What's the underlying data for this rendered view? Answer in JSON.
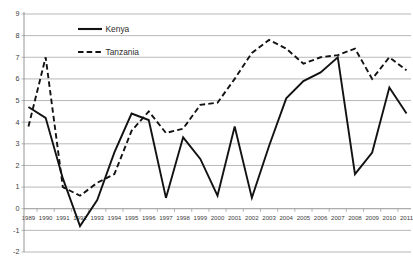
{
  "chart_data": {
    "type": "line",
    "title": "",
    "subtitle": "",
    "xlabel": "",
    "ylabel": "",
    "x": [
      1989,
      1990,
      1991,
      1992,
      1993,
      1994,
      1995,
      1996,
      1997,
      1998,
      1999,
      2000,
      2001,
      2002,
      2003,
      2004,
      2005,
      2006,
      2007,
      2008,
      2009,
      2010,
      2011
    ],
    "categories": [
      "1989",
      "1990",
      "1991",
      "1992",
      "1993",
      "1994",
      "1995",
      "1996",
      "1997",
      "1998",
      "1999",
      "2000",
      "2001",
      "2002",
      "2003",
      "2004",
      "2005",
      "2006",
      "2007",
      "2008",
      "2009",
      "2010",
      "2011"
    ],
    "series": [
      {
        "name": "Kenya",
        "style": "solid",
        "color": "#121212",
        "values": [
          4.7,
          4.2,
          1.4,
          -0.8,
          0.4,
          2.6,
          4.4,
          4.1,
          0.5,
          3.3,
          2.3,
          0.6,
          3.8,
          0.5,
          2.9,
          5.1,
          5.9,
          6.3,
          7.0,
          1.6,
          2.6,
          5.6,
          4.4
        ]
      },
      {
        "name": "Tanzania",
        "style": "dashed",
        "color": "#121212",
        "values": [
          3.8,
          7.0,
          1.0,
          0.6,
          1.2,
          1.6,
          3.6,
          4.5,
          3.5,
          3.7,
          4.8,
          4.9,
          6.0,
          7.2,
          7.8,
          7.4,
          6.7,
          7.0,
          7.1,
          7.4,
          6.0,
          7.0,
          6.4
        ]
      }
    ],
    "ylim": [
      -2,
      9
    ],
    "ytick_values": [
      -2,
      -1,
      0,
      1,
      2,
      3,
      4,
      5,
      6,
      7,
      8,
      9
    ],
    "ytick_labels": [
      "-2",
      "-1",
      "0",
      "1",
      "2",
      "3",
      "4",
      "5",
      "6",
      "7",
      "8",
      "9"
    ],
    "grid": true,
    "grid_axis": "y",
    "legend": {
      "position": "top-center",
      "entries": [
        {
          "label": "Kenya",
          "style": "solid"
        },
        {
          "label": "Tanzania",
          "style": "dashed"
        }
      ]
    }
  }
}
